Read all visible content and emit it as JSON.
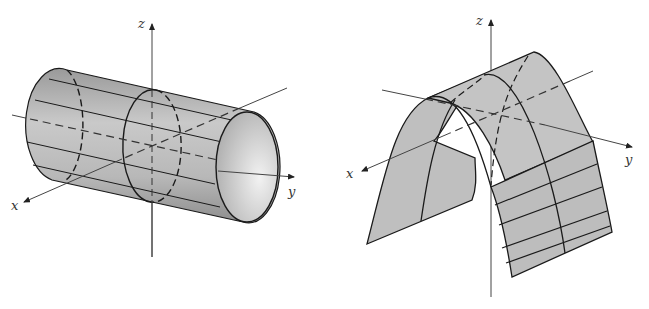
{
  "figures": [
    {
      "id": "left",
      "surface": "circular-cylinder",
      "axes": {
        "x_label": "x",
        "y_label": "y",
        "z_label": "z"
      }
    },
    {
      "id": "right",
      "surface": "parabolic-cylinder",
      "axes": {
        "x_label": "x",
        "y_label": "y",
        "z_label": "z"
      }
    }
  ],
  "colors": {
    "surface_fill": "#bdbdbd",
    "surface_light": "#e6e6e6",
    "line": "#1a1a1a",
    "axis": "#444444",
    "background": "#ffffff"
  }
}
